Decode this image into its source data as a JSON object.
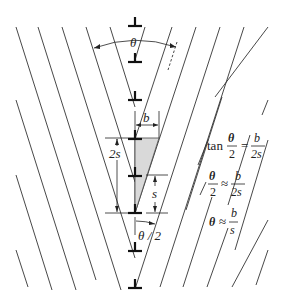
{
  "figure": {
    "colors": {
      "lines": "#333333",
      "dislocations": "#111111",
      "wedge_fill": "#d9d9d9",
      "background": "#ffffff"
    }
  },
  "labels": {
    "theta_top": "θ",
    "b": "b",
    "two_s": "2s",
    "s": "s",
    "theta_half": "θ / 2"
  },
  "equations": {
    "eq1": {
      "lhs_fn": "tan",
      "lhs_num": "θ",
      "lhs_den": "2",
      "op": "=",
      "rhs_num": "b",
      "rhs_den": "2s"
    },
    "eq2": {
      "lhs_num": "θ",
      "lhs_den": "2",
      "op": "≈",
      "rhs_num": "b",
      "rhs_den": "2s"
    },
    "eq3": {
      "lhs": "θ",
      "op": "≈",
      "rhs_num": "b",
      "rhs_den": "s"
    }
  },
  "dislocations": {
    "symbol": "edge-dislocation-perp",
    "x": 135,
    "y_positions": [
      26,
      62,
      100,
      138,
      176,
      213,
      251
    ]
  }
}
